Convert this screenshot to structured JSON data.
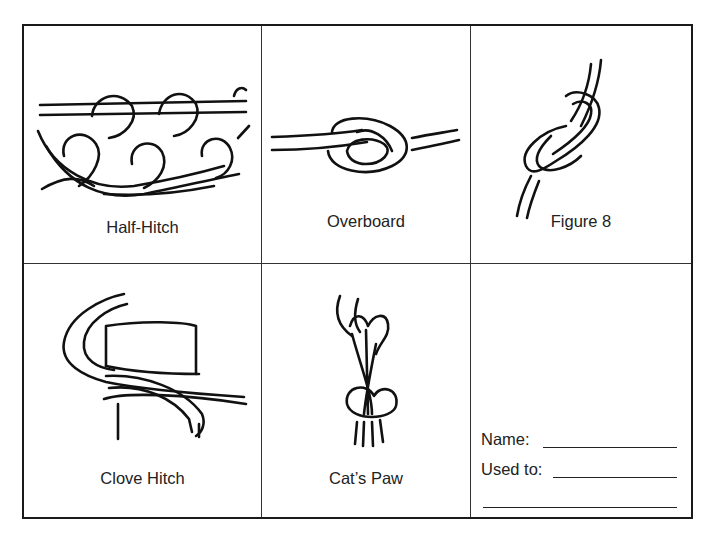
{
  "sheet": {
    "knots": [
      {
        "name": "Half-Hitch",
        "icon": "half-hitch-knot-illustration"
      },
      {
        "name": "Overboard",
        "icon": "overboard-knot-illustration"
      },
      {
        "name": "Figure 8",
        "icon": "figure-8-knot-illustration"
      },
      {
        "name": "Clove Hitch",
        "icon": "clove-hitch-knot-illustration"
      },
      {
        "name": "Cat’s Paw",
        "icon": "cats-paw-knot-illustration"
      }
    ],
    "form": {
      "name_label": "Name:",
      "used_to_label": "Used to:"
    }
  }
}
